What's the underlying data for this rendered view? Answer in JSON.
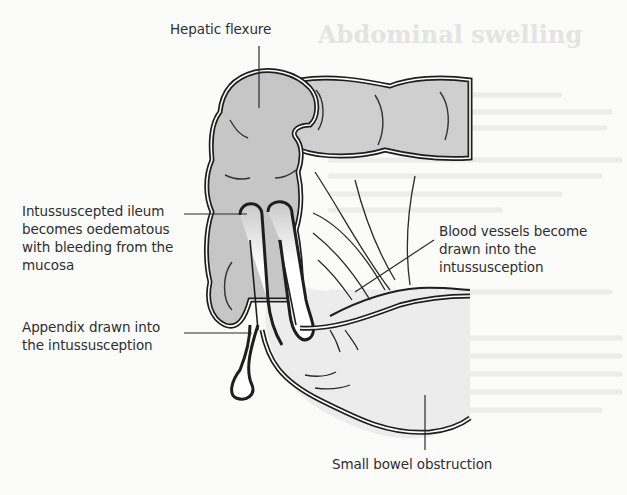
{
  "figure": {
    "colors": {
      "outline": "#1e1e1e",
      "bowel_fill": "#c9c9c9",
      "bowel_fill_light": "#dcdcdc",
      "mesentery_fill": "#ececec",
      "background": "#fbfbfa",
      "label_text": "#2e2e2e"
    }
  },
  "labels": {
    "hepatic_flexure": "Hepatic flexure",
    "intussuscepted_ileum": {
      "lines": [
        "Intussuscepted ileum",
        "becomes oedematous",
        "with bleeding from the",
        "mucosa"
      ]
    },
    "blood_vessels": {
      "lines": [
        "Blood vessels become",
        "drawn into the",
        "intussusception"
      ]
    },
    "appendix": {
      "lines": [
        "Appendix drawn into",
        "the intussusception"
      ]
    },
    "small_bowel_obstruction": "Small bowel obstruction"
  }
}
